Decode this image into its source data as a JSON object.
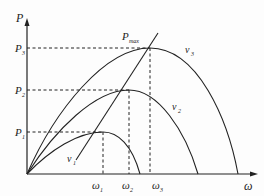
{
  "diagram": {
    "type": "power-speed characteristic curves",
    "axes": {
      "y_label": "P",
      "x_label": "ω"
    },
    "y_ticks": [
      {
        "main": "P",
        "sub": "3"
      },
      {
        "main": "P",
        "sub": "2"
      },
      {
        "main": "P",
        "sub": "1"
      }
    ],
    "x_ticks": [
      {
        "main": "ω",
        "sub": "1"
      },
      {
        "main": "ω",
        "sub": "2"
      },
      {
        "main": "ω",
        "sub": "3"
      }
    ],
    "curves": [
      {
        "main": "v",
        "sub": "1"
      },
      {
        "main": "v",
        "sub": "2"
      },
      {
        "main": "v",
        "sub": "3"
      }
    ],
    "annotation": {
      "main": "P",
      "sub": "max"
    },
    "colors": {
      "stroke": "#222222",
      "background": "#fdfdfd"
    }
  }
}
